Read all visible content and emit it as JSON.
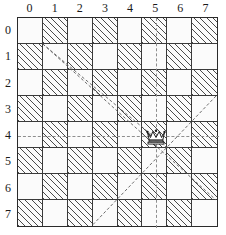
{
  "figure": {
    "board_size": 8,
    "colors": {
      "light_square": "#fbfbfb",
      "hatch_stroke": "#4a4a4a",
      "grid_line": "#3a3a3a",
      "border": "#2b2b2b",
      "attack_line": "#8e8e8e",
      "piece": "#1a1a1a"
    }
  },
  "axes": {
    "column_labels": [
      "0",
      "1",
      "2",
      "3",
      "4",
      "5",
      "6",
      "7"
    ],
    "row_labels": [
      "0",
      "1",
      "2",
      "3",
      "4",
      "5",
      "6",
      "7"
    ]
  },
  "chart_data": {
    "type": "heatmap",
    "xlabel": "",
    "ylabel": "",
    "x": [
      0,
      1,
      2,
      3,
      4,
      5,
      6,
      7
    ],
    "y": [
      0,
      1,
      2,
      3,
      4,
      5,
      6,
      7
    ],
    "categories": [
      "0",
      "1",
      "2",
      "3",
      "4",
      "5",
      "6",
      "7"
    ],
    "grid": true,
    "legend": "none",
    "cell_rule": "hatched when (row + column) is odd",
    "values": [
      [
        0,
        1,
        0,
        1,
        0,
        1,
        0,
        1
      ],
      [
        1,
        0,
        1,
        0,
        1,
        0,
        1,
        0
      ],
      [
        0,
        1,
        0,
        1,
        0,
        1,
        0,
        1
      ],
      [
        1,
        0,
        1,
        0,
        1,
        0,
        1,
        0
      ],
      [
        0,
        1,
        0,
        1,
        0,
        1,
        0,
        1
      ],
      [
        1,
        0,
        1,
        0,
        1,
        0,
        1,
        0
      ],
      [
        0,
        1,
        0,
        1,
        0,
        1,
        0,
        1
      ],
      [
        1,
        0,
        1,
        0,
        1,
        0,
        1,
        0
      ]
    ],
    "pieces": [
      {
        "type": "queen",
        "glyph": "queen-crown",
        "column": 5,
        "row": 4,
        "label": "5,4"
      }
    ],
    "annotations": [
      {
        "name": "rank-attack-line",
        "style": "dashed",
        "orientation": "horizontal",
        "row": 4,
        "from_column": 0,
        "to_column": 7
      },
      {
        "name": "file-attack-line",
        "style": "dashed",
        "orientation": "vertical",
        "column": 5,
        "from_row": 0,
        "to_row": 7
      },
      {
        "name": "diagonal-attack-line",
        "style": "hatch-overlay",
        "orientation": "down-right",
        "from": "1,0",
        "to": "7,6"
      },
      {
        "name": "anti-diagonal-attack-line",
        "style": "hatch-overlay",
        "orientation": "down-left",
        "from": "7,2",
        "to": "2,7"
      }
    ]
  }
}
